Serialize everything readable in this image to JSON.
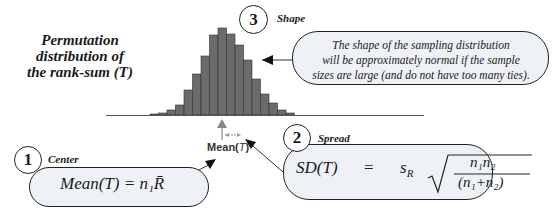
{
  "title": {
    "line1": "Permutation",
    "line2": "distribution of",
    "line3": "the rank-sum  (T)"
  },
  "histogram": {
    "bar_color": "#6b6b6b",
    "bar_heights": [
      1,
      2,
      5,
      10,
      25,
      41,
      59,
      80,
      87,
      81,
      70,
      55,
      36,
      21,
      12,
      5,
      2
    ]
  },
  "mean_marker": {
    "label": "Mean(",
    "var": "T",
    "close": ")"
  },
  "callouts": [
    {
      "number": "3",
      "heading": "Shape",
      "text_line1": "The shape of the sampling distribution",
      "text_line2": "will be approximately normal if the sample",
      "text_line3": "sizes are large (and do not have too many ties)."
    },
    {
      "number": "1",
      "heading": "Center",
      "formula": "Mean(T) = n₁R̄"
    },
    {
      "number": "2",
      "heading": "Spread",
      "formula_lhs": "SD(T)",
      "formula_eq": "=",
      "formula_s": "s",
      "formula_s_sub": "R",
      "formula_num": "n₁n₂",
      "formula_den": "(n₁+n₂)"
    }
  ],
  "colors": {
    "bubble_fill": "#eef2f7",
    "outline": "#222222",
    "arrow_gray": "#888888"
  }
}
